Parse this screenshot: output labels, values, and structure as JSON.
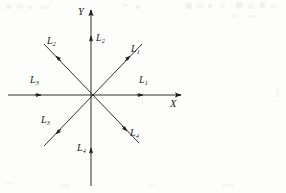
{
  "figure": {
    "background_color": "#fdfdfc",
    "stroke_color": "#1a1a1a",
    "origin": {
      "x": 91,
      "y": 95
    },
    "axes": [
      {
        "name": "x-axis",
        "label": "X",
        "label_position": {
          "x": 170,
          "y": 99
        },
        "orientation": "horizontal",
        "from": {
          "x": 8,
          "y": 95
        },
        "to": {
          "x": 181,
          "y": 95
        }
      },
      {
        "name": "y-axis",
        "label": "Y",
        "label_position": {
          "x": 78,
          "y": 8
        },
        "orientation": "vertical",
        "from": {
          "x": 91,
          "y": 186
        },
        "to": {
          "x": 91,
          "y": 10
        }
      }
    ],
    "vectors": [
      {
        "name": "vector-L1-diagonal",
        "label": "L",
        "subscript": "1",
        "direction_deg": 45,
        "label_position": {
          "x": 131,
          "y": 44
        },
        "arrow_tip": {
          "x": 130,
          "y": 56
        },
        "line_end": {
          "x": 142,
          "y": 44
        }
      },
      {
        "name": "vector-L1-horizontal",
        "label": "L",
        "subscript": "1",
        "direction_deg": 0,
        "label_position": {
          "x": 139,
          "y": 75
        },
        "arrow_tip": {
          "x": 143,
          "y": 95
        },
        "line_end": {
          "x": 181,
          "y": 95
        }
      },
      {
        "name": "vector-L2-diagonal",
        "label": "L",
        "subscript": "2",
        "direction_deg": 135,
        "label_position": {
          "x": 47,
          "y": 36
        },
        "arrow_tip": {
          "x": 56,
          "y": 56
        },
        "line_end": {
          "x": 44,
          "y": 44
        }
      },
      {
        "name": "vector-L2-vertical",
        "label": "L",
        "subscript": "2",
        "direction_deg": 90,
        "label_position": {
          "x": 96,
          "y": 33
        },
        "arrow_tip": {
          "x": 91,
          "y": 36
        },
        "line_end": {
          "x": 91,
          "y": 10
        }
      },
      {
        "name": "vector-L3-horizontal",
        "label": "L",
        "subscript": "3",
        "direction_deg": 180,
        "label_position": {
          "x": 30,
          "y": 75
        },
        "arrow_tip": {
          "x": 41,
          "y": 95
        },
        "line_end": {
          "x": 8,
          "y": 95
        }
      },
      {
        "name": "vector-L3-diagonal",
        "label": "L",
        "subscript": "3",
        "direction_deg": 225,
        "label_position": {
          "x": 41,
          "y": 115
        },
        "arrow_tip": {
          "x": 56,
          "y": 134
        },
        "line_end": {
          "x": 44,
          "y": 146
        }
      },
      {
        "name": "vector-L4-diagonal",
        "label": "L",
        "subscript": "4",
        "direction_deg": 315,
        "label_position": {
          "x": 130,
          "y": 128
        },
        "arrow_tip": {
          "x": 127,
          "y": 131
        },
        "line_end": {
          "x": 139,
          "y": 143
        }
      },
      {
        "name": "vector-L4-vertical",
        "label": "L",
        "subscript": "4",
        "direction_deg": 270,
        "label_position": {
          "x": 77,
          "y": 143
        },
        "arrow_tip": {
          "x": 91,
          "y": 148
        },
        "line_end": {
          "x": 91,
          "y": 186
        }
      }
    ]
  }
}
